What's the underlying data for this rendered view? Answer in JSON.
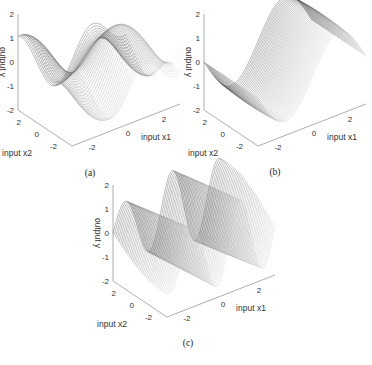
{
  "figure": {
    "panels": [
      {
        "id": "a",
        "caption": "(a)",
        "xlabel": "input x1",
        "ylabel": "input x2",
        "zlabel": "output y"
      },
      {
        "id": "b",
        "caption": "(b)",
        "xlabel": "input x1",
        "ylabel": "input x2",
        "zlabel": "output y"
      },
      {
        "id": "c",
        "caption": "(c)",
        "xlabel": "input x1",
        "ylabel": "input x2",
        "zlabel": "output y"
      }
    ]
  },
  "chart_data": [
    {
      "type": "surface",
      "title": "(a)",
      "xlabel": "input x1",
      "ylabel": "input x2",
      "zlabel": "output y",
      "x_ticks": [
        "-2",
        "0",
        "2"
      ],
      "y_ticks": [
        "2",
        "0",
        "-2"
      ],
      "z_ticks": [
        "2",
        "1",
        "0",
        "-1",
        "-2"
      ],
      "xlim": [
        -3,
        3
      ],
      "ylim": [
        -3,
        3
      ],
      "zlim": [
        -2,
        2
      ],
      "description": "Wavy wireframe surface with multiple peaks (~1.5) and troughs (~-2) along x1, moderate variation along x2"
    },
    {
      "type": "surface",
      "title": "(b)",
      "xlabel": "input x1",
      "ylabel": "input x2",
      "zlabel": "output y",
      "x_ticks": [
        "-2",
        "0",
        "2"
      ],
      "y_ticks": [
        "2",
        "0",
        "-2"
      ],
      "z_ticks": [
        "2",
        "1",
        "0",
        "-1",
        "-2"
      ],
      "xlim": [
        -3,
        3
      ],
      "ylim": [
        -3,
        3
      ],
      "zlim": [
        -2,
        2
      ],
      "description": "Smooth single-period sinusoidal surface, trough ~-1.8 near x1≈-1, peak ~1.5 near x1≈1"
    },
    {
      "type": "surface",
      "title": "(c)",
      "xlabel": "input x1",
      "ylabel": "input x2",
      "zlabel": "output y",
      "x_ticks": [
        "-2",
        "0",
        "2"
      ],
      "y_ticks": [
        "2",
        "0",
        "-2"
      ],
      "z_ticks": [
        "2",
        "1",
        "0",
        "-1",
        "-2"
      ],
      "xlim": [
        -3,
        3
      ],
      "ylim": [
        -3,
        3
      ],
      "zlim": [
        -2,
        2
      ],
      "description": "High-frequency oscillating surface with deep troughs (~-2) and peaks (~1.8) across x1"
    }
  ]
}
